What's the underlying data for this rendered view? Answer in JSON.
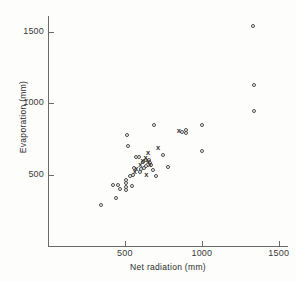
{
  "chart_data": {
    "type": "scatter",
    "title": "",
    "xlabel": "Net  radiation (mm)",
    "ylabel": "Evaporation (mm)",
    "xlim": [
      0,
      1560
    ],
    "ylim": [
      0,
      1610
    ],
    "xticks": [
      500,
      1000,
      1500
    ],
    "xtick_labels": [
      "500",
      "1000",
      "1500"
    ],
    "yticks": [
      500,
      1000,
      1500
    ],
    "ytick_labels": [
      "500",
      "1000",
      "1500"
    ],
    "grid": false,
    "legend": null,
    "series": [
      {
        "name": "open-circle",
        "marker": "circle",
        "points": [
          [
            345,
            290
          ],
          [
            440,
            335
          ],
          [
            425,
            425
          ],
          [
            455,
            430
          ],
          [
            470,
            400
          ],
          [
            510,
            465
          ],
          [
            510,
            440
          ],
          [
            510,
            415
          ],
          [
            510,
            390
          ],
          [
            545,
            420
          ],
          [
            530,
            490
          ],
          [
            555,
            500
          ],
          [
            560,
            545
          ],
          [
            575,
            620
          ],
          [
            590,
            625
          ],
          [
            600,
            520
          ],
          [
            605,
            540
          ],
          [
            620,
            590
          ],
          [
            625,
            545
          ],
          [
            635,
            560
          ],
          [
            640,
            600
          ],
          [
            655,
            600
          ],
          [
            660,
            580
          ],
          [
            670,
            570
          ],
          [
            685,
            535
          ],
          [
            690,
            845
          ],
          [
            705,
            490
          ],
          [
            515,
            780
          ],
          [
            520,
            700
          ],
          [
            745,
            640
          ],
          [
            780,
            555
          ],
          [
            870,
            800
          ],
          [
            895,
            810
          ],
          [
            895,
            790
          ],
          [
            1000,
            845
          ],
          [
            1000,
            665
          ],
          [
            1335,
            1540
          ],
          [
            1340,
            1125
          ],
          [
            1340,
            945
          ]
        ]
      },
      {
        "name": "cross",
        "marker": "x",
        "points": [
          [
            565,
            515
          ],
          [
            575,
            540
          ],
          [
            600,
            565
          ],
          [
            615,
            595
          ],
          [
            635,
            615
          ],
          [
            650,
            650
          ],
          [
            650,
            590
          ],
          [
            660,
            570
          ],
          [
            640,
            500
          ],
          [
            715,
            685
          ],
          [
            850,
            805
          ]
        ]
      }
    ]
  },
  "axes": {
    "x_title": "Net  radiation (mm)",
    "y_title": "Evaporation (mm)"
  },
  "figure": {
    "top_mark": ""
  }
}
